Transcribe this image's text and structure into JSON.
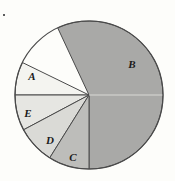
{
  "figure": {
    "background_color": "#fdfdfa",
    "width": 175,
    "height": 181
  },
  "chart_data": {
    "type": "pie",
    "title": "",
    "subtitle": "",
    "xlabel": "",
    "ylabel": "",
    "legend_position": "none",
    "grid": false,
    "labels_inside_slices": true,
    "center": {
      "x": 89,
      "y": 95
    },
    "radius": 74,
    "outline_color": "#4a4a4a",
    "outline_width": 1,
    "start_angle_deg": 0,
    "direction": "counterclockwise",
    "categories": [
      "B",
      "A",
      "E",
      "D",
      "C"
    ],
    "values": [
      56.9,
      7.2,
      7.8,
      8.3,
      19.8
    ],
    "unit": "percent",
    "slices": [
      {
        "label": "B",
        "value": 56.9,
        "angle_deg": 205,
        "start_deg": 270,
        "end_deg": 115,
        "color": "#a9a9a7",
        "label_x": 132,
        "label_y": 64
      },
      {
        "label": "A",
        "value": 7.2,
        "angle_deg": 26,
        "start_deg": 154,
        "end_deg": 180,
        "color": "#f4f4f0",
        "label_x": 32,
        "label_y": 76
      },
      {
        "label": "E",
        "value": 7.8,
        "angle_deg": 28,
        "start_deg": 180,
        "end_deg": 208,
        "color": "#e6e6e2",
        "label_x": 28,
        "label_y": 113
      },
      {
        "label": "D",
        "value": 8.3,
        "angle_deg": 30,
        "start_deg": 208,
        "end_deg": 238,
        "color": "#dadad6",
        "label_x": 50,
        "label_y": 140
      },
      {
        "label": "C",
        "value": 19.8,
        "angle_deg": 32,
        "start_deg": 238,
        "end_deg": 270,
        "color": "#bdbdba",
        "label_x": 73,
        "label_y": 157
      }
    ],
    "artifacts": [
      {
        "name": "scan-speck",
        "x": 3,
        "y": 14
      },
      {
        "name": "center-highlight-line",
        "from_x": 89,
        "to_x": 163,
        "y": 95
      }
    ]
  }
}
